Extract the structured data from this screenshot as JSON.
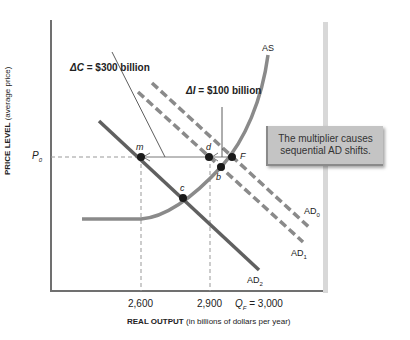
{
  "diagram": {
    "y_axis_label_bold": "PRICE LEVEL",
    "y_axis_label_rest": " (average price)",
    "x_axis_label_bold": "REAL OUTPUT",
    "x_axis_label_rest": " (in billions of dollars per year)",
    "y_tick": "P",
    "y_tick_sub": "0",
    "x_ticks": [
      {
        "label": "2,600",
        "value": 2600
      },
      {
        "label": "2,900",
        "value": 2900
      },
      {
        "label": "Q",
        "sub": "F",
        "suffix": " = 3,000",
        "value": 3000
      }
    ],
    "curves": {
      "as": "AS",
      "ad0": "AD",
      "ad0_sub": "0",
      "ad1": "AD",
      "ad1_sub": "1",
      "ad2": "AD",
      "ad2_sub": "2"
    },
    "points": [
      "m",
      "d",
      "F",
      "b",
      "c"
    ],
    "annotations": {
      "delta_c_symbol": "ΔC",
      "delta_c_value": " = $300 billion",
      "delta_i_symbol": "ΔI",
      "delta_i_value": " = $100 billion"
    },
    "callout": "The multiplier causes sequential AD shifts.",
    "colors": {
      "axis": "#707070",
      "curve": "#8a8a8a",
      "ad2": "#606060",
      "point": "#1a1a1a",
      "callout_bg": "#c4c4c4"
    }
  }
}
